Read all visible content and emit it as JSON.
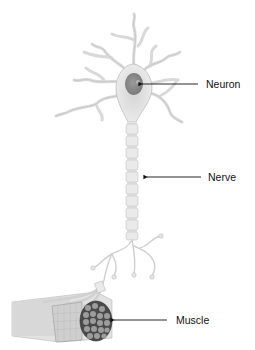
{
  "diagram": {
    "labels": [
      {
        "id": "neuron",
        "text": "Neuron"
      },
      {
        "id": "nerve",
        "text": "Nerve"
      },
      {
        "id": "muscle",
        "text": "Muscle"
      }
    ],
    "colors": {
      "background": "#ffffff",
      "cell_fill": "#e8e8e8",
      "cell_stroke": "#bdbdbd",
      "nucleus": "#8a8a8a",
      "muscle_dark": "#4a4a4a",
      "muscle_fiber": "#9a9a9a",
      "arrow": "#111111",
      "text": "#111111"
    }
  }
}
